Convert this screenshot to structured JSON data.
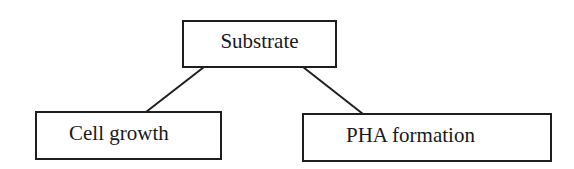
{
  "diagram": {
    "type": "tree",
    "nodes": [
      {
        "id": "substrate",
        "label": "Substrate"
      },
      {
        "id": "cell_growth",
        "label": "Cell growth"
      },
      {
        "id": "pha_formation",
        "label": "PHA formation"
      }
    ],
    "edges": [
      {
        "from": "substrate",
        "to": "cell_growth"
      },
      {
        "from": "substrate",
        "to": "pha_formation"
      }
    ],
    "colors": {
      "stroke": "#1e1e1e",
      "text": "#1a1a1a",
      "background": "#ffffff"
    }
  }
}
